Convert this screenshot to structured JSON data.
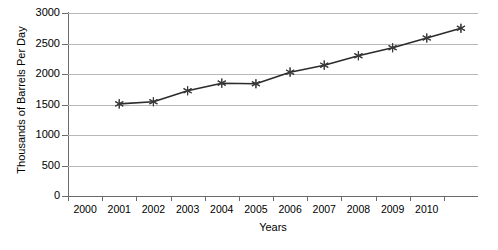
{
  "chart_data": {
    "type": "line",
    "title": "",
    "xlabel": "Years",
    "ylabel": "Thousands of Barrels Per Day",
    "x": [
      2001,
      2002,
      2003,
      2004,
      2005,
      2006,
      2007,
      2008,
      2009,
      2010,
      2011
    ],
    "values": [
      1510,
      1545,
      1725,
      1850,
      1840,
      2030,
      2145,
      2300,
      2430,
      2590,
      2750
    ],
    "series": [
      {
        "name": "Thousands of Barrels Per Day",
        "values": [
          1510,
          1545,
          1725,
          1850,
          1840,
          2030,
          2145,
          2300,
          2430,
          2590,
          2750
        ]
      }
    ],
    "x_tick_labels": [
      "2000",
      "2001",
      "2002",
      "2003",
      "2004",
      "2005",
      "2006",
      "2007",
      "2008",
      "2009",
      "2010"
    ],
    "y_tick_labels": [
      "0",
      "500",
      "1000",
      "1500",
      "2000",
      "2500",
      "3000"
    ],
    "y_ticks": [
      0,
      500,
      1000,
      1500,
      2000,
      2500,
      3000
    ],
    "ylim": [
      0,
      3000
    ],
    "grid": true,
    "legend": false,
    "legend_position": "none",
    "marker": "asterisk",
    "line_color": "#2b2b2b",
    "grid_color": "#b8b8b8",
    "axis_color": "#6b6b6b",
    "background_color": "#ffffff"
  },
  "axes": {
    "y_title": "Thousands of Barrels Per Day",
    "x_title": "Years"
  }
}
